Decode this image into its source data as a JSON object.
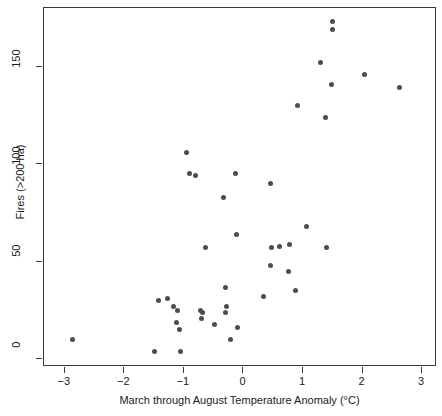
{
  "chart_data": {
    "type": "scatter",
    "title": "",
    "xlabel": "March through August Temperature Anomaly (°C)",
    "ylabel": "Fires (>200 ha)",
    "xlim": [
      -3.35,
      3.25
    ],
    "ylim": [
      -4,
      180
    ],
    "xticks": [
      -3,
      -2,
      -1,
      0,
      1,
      2,
      3
    ],
    "xticklabels": [
      "−3",
      "−2",
      "−1",
      "0",
      "1",
      "2",
      "3"
    ],
    "yticks": [
      0,
      50,
      100,
      150
    ],
    "yticklabels": [
      "0",
      "50",
      "100",
      "150"
    ],
    "grid": false,
    "legend": null,
    "marker": {
      "shape": "circle",
      "color": "#4d4d4d",
      "size": 5
    },
    "series": [
      {
        "name": "Fires vs temperature anomaly",
        "points": [
          [
            -2.87,
            10
          ],
          [
            -1.5,
            4
          ],
          [
            -1.43,
            30
          ],
          [
            -1.28,
            31
          ],
          [
            -1.17,
            27
          ],
          [
            -1.1,
            25
          ],
          [
            -1.13,
            19
          ],
          [
            -1.08,
            15
          ],
          [
            -1.06,
            4
          ],
          [
            -0.96,
            106
          ],
          [
            -0.9,
            95
          ],
          [
            -0.81,
            94
          ],
          [
            -0.72,
            25
          ],
          [
            -0.68,
            24
          ],
          [
            -0.7,
            21
          ],
          [
            -0.64,
            57
          ],
          [
            -0.49,
            18
          ],
          [
            -0.33,
            83
          ],
          [
            -0.3,
            37
          ],
          [
            -0.28,
            27
          ],
          [
            -0.3,
            24
          ],
          [
            -0.22,
            10
          ],
          [
            -0.14,
            95
          ],
          [
            -0.12,
            64
          ],
          [
            -0.1,
            16
          ],
          [
            0.33,
            32
          ],
          [
            0.45,
            90
          ],
          [
            0.45,
            48
          ],
          [
            0.47,
            57
          ],
          [
            0.6,
            58
          ],
          [
            0.75,
            45
          ],
          [
            0.78,
            59
          ],
          [
            0.88,
            35
          ],
          [
            0.9,
            130
          ],
          [
            1.05,
            68
          ],
          [
            1.3,
            152
          ],
          [
            1.38,
            124
          ],
          [
            1.4,
            57
          ],
          [
            1.47,
            141
          ],
          [
            1.5,
            173
          ],
          [
            1.5,
            169
          ],
          [
            2.03,
            146
          ],
          [
            2.62,
            139
          ]
        ]
      }
    ]
  }
}
